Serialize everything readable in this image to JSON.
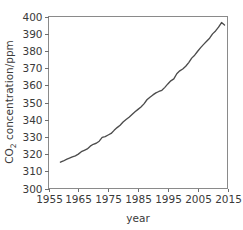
{
  "chart_data": {
    "type": "line",
    "title": "",
    "xlabel": "year",
    "ylabel": "CO2 concentration/ppm",
    "ylabel_parts": {
      "pre": "CO",
      "sub": "2",
      "post": " concentration/ppm"
    },
    "xlim": [
      1955,
      2015
    ],
    "ylim": [
      300,
      400
    ],
    "xticks": [
      1955,
      1965,
      1975,
      1985,
      1995,
      2005,
      2015
    ],
    "yticks": [
      300,
      310,
      320,
      330,
      340,
      350,
      360,
      370,
      380,
      390,
      400
    ],
    "xtick_labels": [
      "1955",
      "1965",
      "1975",
      "1985",
      "1995",
      "2005",
      "2015"
    ],
    "ytick_labels": [
      "300",
      "310",
      "320",
      "330",
      "340",
      "350",
      "360",
      "370",
      "380",
      "390",
      "400"
    ],
    "grid": false,
    "legend": false,
    "legend_position": "none",
    "line_color": "#4c4c4c",
    "axis_color": "#8a8a8a",
    "background_color": "#ffffff",
    "series": [
      {
        "name": "CO2 concentration",
        "x": [
          1959,
          1960,
          1961,
          1962,
          1963,
          1964,
          1965,
          1966,
          1967,
          1968,
          1969,
          1970,
          1971,
          1972,
          1973,
          1974,
          1975,
          1976,
          1977,
          1978,
          1979,
          1980,
          1981,
          1982,
          1983,
          1984,
          1985,
          1986,
          1987,
          1988,
          1989,
          1990,
          1991,
          1992,
          1993,
          1994,
          1995,
          1996,
          1997,
          1998,
          1999,
          2000,
          2001,
          2002,
          2003,
          2004,
          2005,
          2006,
          2007,
          2008,
          2009,
          2010,
          2011,
          2012,
          2013,
          2014
        ],
        "values": [
          315.3,
          316.0,
          316.9,
          317.6,
          318.4,
          319.0,
          320.0,
          321.4,
          322.2,
          323.0,
          324.6,
          325.7,
          326.3,
          327.5,
          329.7,
          330.2,
          331.1,
          332.0,
          333.8,
          335.4,
          336.8,
          338.7,
          340.1,
          341.4,
          343.0,
          344.6,
          346.0,
          347.4,
          349.2,
          351.6,
          353.1,
          354.4,
          355.6,
          356.4,
          357.1,
          358.8,
          360.8,
          362.6,
          363.7,
          366.7,
          368.4,
          369.5,
          371.1,
          373.2,
          375.8,
          377.5,
          379.8,
          381.9,
          383.8,
          385.6,
          387.4,
          389.9,
          391.6,
          393.8,
          396.5,
          395.0
        ]
      }
    ]
  },
  "figure": {
    "name": "co2-concentration-line-chart"
  }
}
